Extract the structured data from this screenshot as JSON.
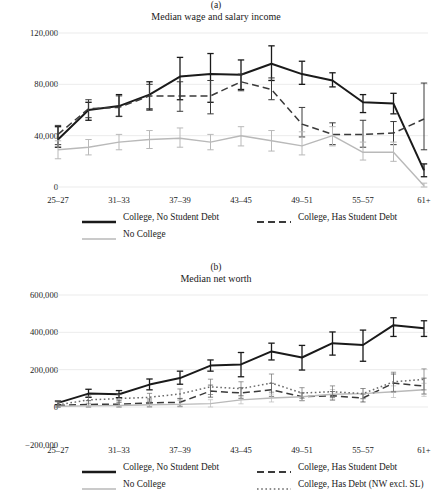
{
  "figure": {
    "panels": [
      {
        "key": "a",
        "label": "(a)",
        "title": "Median wage and salary income"
      },
      {
        "key": "b",
        "label": "(b)",
        "title": "Median net worth"
      }
    ]
  },
  "colors": {
    "black": "#1a1a1a",
    "gray": "#b9b9b9",
    "dark_dashed": "#3a3a3a",
    "dotted": "#6b6b6b",
    "gridline": "#e6e6e6",
    "text": "#1a1a1a"
  },
  "legend_a": {
    "rows": [
      [
        {
          "label": "College, No Student Debt",
          "style": "solid",
          "color": "#1a1a1a",
          "swatch": "line-solid-thick"
        },
        {
          "label": "College, Has Student Debt",
          "style": "dashed",
          "color": "#3a3a3a",
          "swatch": "line-dashed"
        }
      ],
      [
        {
          "label": "No College",
          "style": "solid",
          "color": "#b9b9b9",
          "swatch": "line-solid-thin-gray"
        }
      ]
    ]
  },
  "legend_b": {
    "rows": [
      [
        {
          "label": "College, No Student Debt",
          "style": "solid",
          "color": "#1a1a1a",
          "swatch": "line-solid-thick"
        },
        {
          "label": "College, Has Student Debt",
          "style": "dashed",
          "color": "#3a3a3a",
          "swatch": "line-dashed"
        }
      ],
      [
        {
          "label": "No College",
          "style": "solid",
          "color": "#b9b9b9",
          "swatch": "line-solid-thin-gray"
        },
        {
          "label": "College, Has Debt (NW excl. SL)",
          "style": "dotted",
          "color": "#6b6b6b",
          "swatch": "line-dotted"
        }
      ]
    ]
  },
  "chart_data": [
    {
      "type": "line",
      "panel": "a",
      "title": "Median wage and salary income",
      "subtitle": "(a)",
      "xlabel": "",
      "ylabel": "",
      "grid": true,
      "legend_position": "bottom",
      "errorbars": true,
      "x": [
        0,
        1,
        2,
        3,
        4,
        5,
        6,
        7,
        8,
        9,
        10,
        11,
        12
      ],
      "xtick_positions": [
        0,
        2,
        4,
        6,
        8,
        10,
        12
      ],
      "xtick_labels": [
        "25–27",
        "31–33",
        "37–39",
        "43–45",
        "49–51",
        "55–57",
        "61+"
      ],
      "ytick_values": [
        0,
        40000,
        80000,
        120000
      ],
      "ytick_labels": [
        "0",
        "40,000",
        "80,000",
        "120,000"
      ],
      "ylim": [
        0,
        120000
      ],
      "series": [
        {
          "name": "College, No Student Debt",
          "style": "solid",
          "color": "#1a1a1a",
          "values": [
            37000,
            60000,
            63000,
            72000,
            86000,
            88000,
            87500,
            96000,
            88000,
            83000,
            66000,
            65000,
            13000
          ],
          "err_low": [
            31000,
            52000,
            55000,
            60000,
            68000,
            66000,
            76000,
            83000,
            80000,
            78000,
            58000,
            57000,
            8000
          ],
          "err_high": [
            47000,
            66000,
            72000,
            82000,
            101000,
            104000,
            99000,
            110000,
            98000,
            89000,
            72000,
            73000,
            18000
          ]
        },
        {
          "name": "College, Has Student Debt",
          "style": "dashed",
          "color": "#3a3a3a",
          "values": [
            41000,
            61000,
            62000,
            71000,
            71000,
            71000,
            82000,
            76000,
            49000,
            41000,
            41000,
            42000,
            53000
          ],
          "err_low": [
            33000,
            54000,
            55000,
            61000,
            59000,
            57000,
            75000,
            68000,
            39000,
            33000,
            31000,
            33000,
            29000
          ],
          "err_high": [
            48000,
            68000,
            71000,
            80000,
            82000,
            83000,
            88000,
            85000,
            62000,
            50000,
            52000,
            51000,
            81000
          ]
        },
        {
          "name": "No College",
          "style": "solid",
          "color": "#b9b9b9",
          "values": [
            29000,
            31000,
            35000,
            37000,
            38000,
            35000,
            40000,
            36000,
            32000,
            40000,
            27000,
            27000,
            1000
          ],
          "err_low": [
            22000,
            25000,
            29000,
            30000,
            31000,
            29000,
            32000,
            28000,
            25000,
            32000,
            21000,
            20000,
            0
          ],
          "err_high": [
            36000,
            37000,
            41000,
            44000,
            46000,
            41000,
            47000,
            44000,
            43000,
            47000,
            35000,
            35000,
            3000
          ]
        }
      ]
    },
    {
      "type": "line",
      "panel": "b",
      "title": "Median net worth",
      "subtitle": "(b)",
      "xlabel": "",
      "ylabel": "",
      "grid": true,
      "legend_position": "bottom",
      "errorbars": true,
      "x": [
        0,
        1,
        2,
        3,
        4,
        5,
        6,
        7,
        8,
        9,
        10,
        11,
        12
      ],
      "xtick_positions": [
        0,
        2,
        4,
        6,
        8,
        10,
        12
      ],
      "xtick_labels": [
        "25–27",
        "31–33",
        "37–39",
        "43–45",
        "49–51",
        "55–57",
        "61+"
      ],
      "ytick_values": [
        -200000,
        0,
        200000,
        400000,
        600000
      ],
      "ytick_labels": [
        "−200,000",
        "0",
        "200,000",
        "400,000",
        "600,000"
      ],
      "ylim": [
        -200000,
        600000
      ],
      "series": [
        {
          "name": "College, No Student Debt",
          "style": "solid",
          "color": "#1a1a1a",
          "values": [
            22000,
            72000,
            68000,
            120000,
            155000,
            222000,
            228000,
            298000,
            265000,
            342000,
            332000,
            438000,
            422000
          ],
          "err_low": [
            12000,
            52000,
            50000,
            92000,
            122000,
            192000,
            162000,
            252000,
            198000,
            278000,
            245000,
            378000,
            378000
          ],
          "err_high": [
            32000,
            95000,
            88000,
            150000,
            192000,
            252000,
            292000,
            342000,
            330000,
            402000,
            412000,
            478000,
            462000
          ]
        },
        {
          "name": "College, Has Student Debt",
          "style": "dashed",
          "color": "#3a3a3a",
          "values": [
            8000,
            14000,
            15000,
            22000,
            25000,
            85000,
            75000,
            92000,
            55000,
            60000,
            48000,
            128000,
            112000
          ]
        },
        {
          "name": "No College",
          "style": "solid",
          "color": "#b9b9b9",
          "values": [
            4000,
            6000,
            8000,
            12000,
            14000,
            18000,
            38000,
            48000,
            55000,
            68000,
            72000,
            82000,
            92000
          ]
        },
        {
          "name": "College, Has Debt (NW excl. SL)",
          "style": "dotted",
          "color": "#6b6b6b",
          "values": [
            12000,
            38000,
            45000,
            52000,
            70000,
            108000,
            98000,
            128000,
            75000,
            82000,
            72000,
            135000,
            148000
          ]
        }
      ]
    }
  ]
}
